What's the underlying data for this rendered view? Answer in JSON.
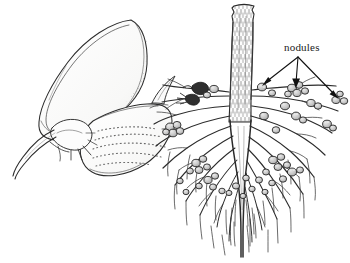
{
  "figure": {
    "background_color": "#ffffff",
    "ink_color": "#2b2b2b",
    "nodule_fill": "#c9c9c9",
    "petal_fill": "#fbfbfa",
    "stem_fill": "#fdfdfd"
  },
  "annotations": {
    "nodules_label": "nodules",
    "label_position": {
      "x": 284,
      "y": 42
    },
    "arrow_origin": {
      "x": 298,
      "y": 57
    },
    "arrow_targets": [
      {
        "x": 262,
        "y": 86
      },
      {
        "x": 296,
        "y": 88
      },
      {
        "x": 339,
        "y": 99
      }
    ],
    "arrow_count": 3
  },
  "panels": {
    "left": {
      "name": "legume-flower",
      "parts": [
        "standard-petal",
        "wing-petal",
        "keel-petal",
        "calyx",
        "pedicel"
      ]
    },
    "right": {
      "name": "root-system",
      "parts": [
        "stem",
        "taproot",
        "lateral-roots",
        "root-hairs",
        "nodules"
      ]
    }
  }
}
